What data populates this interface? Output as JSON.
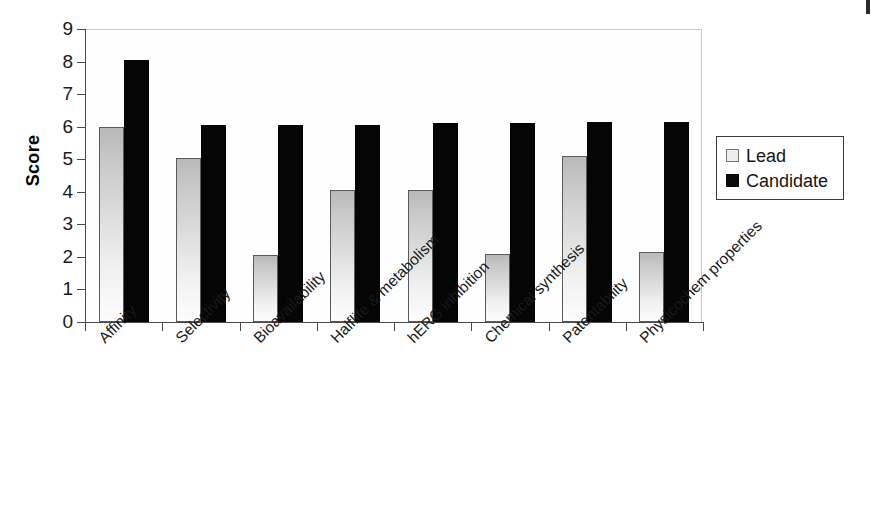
{
  "chart_data": {
    "type": "bar",
    "title": "",
    "xlabel": "",
    "ylabel": "Score",
    "ylim": [
      0,
      9
    ],
    "yticks": [
      0,
      1,
      2,
      3,
      4,
      5,
      6,
      7,
      8,
      9
    ],
    "grid": false,
    "legend_position": "right",
    "categories": [
      "Affinity",
      "Selectivity",
      "Bioavailability",
      "Halflife & metabolism",
      "hERG inhibition",
      "Chemical synthesis",
      "Patentability",
      "Physicochem properties"
    ],
    "series": [
      {
        "name": "Lead",
        "color": "#d0d0d0",
        "values": [
          6.0,
          5.05,
          2.05,
          4.05,
          4.05,
          2.1,
          5.1,
          2.15
        ]
      },
      {
        "name": "Candidate",
        "color": "#050505",
        "values": [
          8.05,
          6.05,
          6.05,
          6.05,
          6.1,
          6.1,
          6.15,
          6.15
        ]
      }
    ]
  },
  "legend": {
    "entries": [
      {
        "label": "Lead",
        "swatch": "lead-swatch"
      },
      {
        "label": "Candidate",
        "swatch": "candidate-swatch"
      }
    ]
  },
  "axis": {
    "y_title": "Score"
  }
}
